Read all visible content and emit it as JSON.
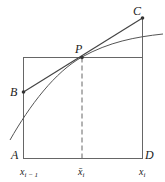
{
  "diagram": {
    "points": {
      "A": {
        "label": "A"
      },
      "B": {
        "label": "B"
      },
      "C": {
        "label": "C"
      },
      "D": {
        "label": "D"
      },
      "P": {
        "label": "P"
      }
    },
    "axis_labels": {
      "left": {
        "base": "x",
        "sub": "i − 1"
      },
      "mid": {
        "base": "x̄",
        "sub": "i"
      },
      "right": {
        "base": "x",
        "sub": "i"
      }
    },
    "colors": {
      "line": "#555555",
      "curve": "#444444",
      "text": "#222222",
      "background": "#ffffff"
    }
  }
}
